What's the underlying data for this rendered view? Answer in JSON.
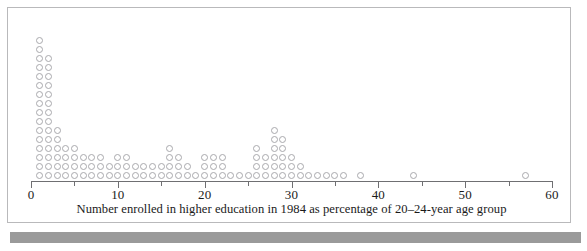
{
  "figure": {
    "caption": "Number enrolled in higher education in 1984 as percentage of 20–24-year age group",
    "frame_color": "#b9b9bb",
    "band_color": "#9a9a9a",
    "dot_color": "#a9a9ad",
    "axis_color": "#6f6f72"
  },
  "axis": {
    "major_ticks": [
      0,
      10,
      20,
      30,
      40,
      50,
      60
    ],
    "minor_ticks": [
      5,
      15,
      25,
      35,
      45,
      55
    ],
    "major_labels": [
      "0",
      "10",
      "20",
      "30",
      "40",
      "50",
      "60"
    ],
    "min": 0,
    "max": 60
  },
  "chart_data": {
    "type": "dotplot",
    "title": "",
    "subtitle": "",
    "xlabel": "Number enrolled in higher education in 1984 as percentage of 20–24-year age group",
    "ylabel": "",
    "xlim": [
      0,
      60
    ],
    "grid": false,
    "legend": "none",
    "bin_width": 1,
    "dot_diameter_px": 7,
    "note": "Each circle represents one country; stacks show frequency at each percentage value.",
    "categories": [
      1,
      2,
      3,
      4,
      5,
      6,
      7,
      8,
      9,
      10,
      11,
      12,
      13,
      14,
      15,
      16,
      17,
      18,
      19,
      20,
      21,
      22,
      23,
      24,
      25,
      26,
      27,
      28,
      29,
      30,
      31,
      32,
      33,
      34,
      35,
      36,
      37,
      38,
      44,
      57
    ],
    "values": [
      16,
      14,
      6,
      4,
      4,
      3,
      3,
      3,
      2,
      3,
      3,
      2,
      2,
      2,
      2,
      4,
      3,
      2,
      1,
      3,
      3,
      3,
      1,
      1,
      1,
      4,
      3,
      6,
      5,
      3,
      2,
      1,
      1,
      1,
      1,
      1,
      0,
      1,
      1,
      1
    ],
    "dots": [
      {
        "x": 1,
        "count": 16
      },
      {
        "x": 2,
        "count": 14
      },
      {
        "x": 3,
        "count": 6
      },
      {
        "x": 4,
        "count": 4
      },
      {
        "x": 5,
        "count": 4
      },
      {
        "x": 6,
        "count": 3
      },
      {
        "x": 7,
        "count": 3
      },
      {
        "x": 8,
        "count": 3
      },
      {
        "x": 9,
        "count": 2
      },
      {
        "x": 10,
        "count": 3
      },
      {
        "x": 11,
        "count": 3
      },
      {
        "x": 12,
        "count": 2
      },
      {
        "x": 13,
        "count": 2
      },
      {
        "x": 14,
        "count": 2
      },
      {
        "x": 15,
        "count": 2
      },
      {
        "x": 16,
        "count": 4
      },
      {
        "x": 17,
        "count": 3
      },
      {
        "x": 18,
        "count": 2
      },
      {
        "x": 19,
        "count": 1
      },
      {
        "x": 20,
        "count": 3
      },
      {
        "x": 21,
        "count": 3
      },
      {
        "x": 22,
        "count": 3
      },
      {
        "x": 23,
        "count": 1
      },
      {
        "x": 24,
        "count": 1
      },
      {
        "x": 25,
        "count": 1
      },
      {
        "x": 26,
        "count": 4
      },
      {
        "x": 27,
        "count": 3
      },
      {
        "x": 28,
        "count": 6
      },
      {
        "x": 29,
        "count": 5
      },
      {
        "x": 30,
        "count": 3
      },
      {
        "x": 31,
        "count": 2
      },
      {
        "x": 32,
        "count": 1
      },
      {
        "x": 33,
        "count": 1
      },
      {
        "x": 34,
        "count": 1
      },
      {
        "x": 35,
        "count": 1
      },
      {
        "x": 36,
        "count": 1
      },
      {
        "x": 38,
        "count": 1
      },
      {
        "x": 44,
        "count": 1
      },
      {
        "x": 57,
        "count": 1
      }
    ]
  }
}
